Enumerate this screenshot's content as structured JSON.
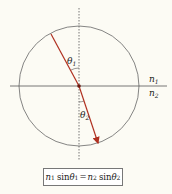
{
  "diagram": {
    "type": "snell-law-refraction",
    "colors": {
      "ray": "#b03020",
      "lines": "#555555",
      "background": "#fcfbf4"
    },
    "labels": {
      "n1": "n",
      "n1_sub": "1",
      "n2": "n",
      "n2_sub": "2",
      "theta1": "θ",
      "theta1_sub": "1",
      "theta2": "θ",
      "theta2_sub": "2"
    },
    "formula": {
      "lhs_n": "n",
      "lhs_n_sub": "1",
      "lhs_sin": "sin",
      "lhs_theta": "θ",
      "lhs_theta_sub": "1",
      "equals": "=",
      "rhs_n": "n",
      "rhs_n_sub": "2",
      "rhs_sin": "sin",
      "rhs_theta": "θ",
      "rhs_theta_sub": "2"
    }
  }
}
